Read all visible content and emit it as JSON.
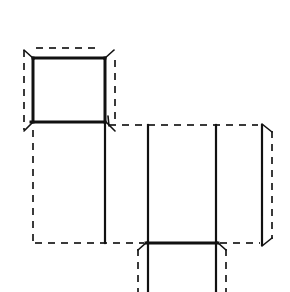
{
  "figure": {
    "background_color": "#ffffff",
    "solid_line_color": "#111111",
    "dashed_line_color": "#3a3a3a",
    "canvas": {
      "width": 290,
      "height": 292
    }
  },
  "geometry": {
    "solid_edges": [
      {
        "name": "top-square-top-edge",
        "x1": 33,
        "y1": 58,
        "x2": 105,
        "y2": 58
      },
      {
        "name": "top-square-left-edge",
        "x1": 33,
        "y1": 58,
        "x2": 33,
        "y2": 122
      },
      {
        "name": "top-square-bottom-edge",
        "x1": 31,
        "y1": 122,
        "x2": 105,
        "y2": 122
      },
      {
        "name": "top-square-right-edge",
        "x1": 105,
        "y1": 58,
        "x2": 105,
        "y2": 122
      },
      {
        "name": "left-panel-right-fold",
        "x1": 105,
        "y1": 122,
        "x2": 105,
        "y2": 243
      },
      {
        "name": "center-panel-left-fold",
        "x1": 148,
        "y1": 125,
        "x2": 148,
        "y2": 243
      },
      {
        "name": "center-panel-right-fold",
        "x1": 216,
        "y1": 125,
        "x2": 216,
        "y2": 243
      },
      {
        "name": "right-panel-right-edge",
        "x1": 262,
        "y1": 125,
        "x2": 262,
        "y2": 245
      },
      {
        "name": "center-panel-bottom-edge",
        "x1": 146,
        "y1": 243,
        "x2": 218,
        "y2": 243
      },
      {
        "name": "bottom-flap-left-fold",
        "x1": 148,
        "y1": 243,
        "x2": 148,
        "y2": 292
      },
      {
        "name": "bottom-flap-right-fold",
        "x1": 216,
        "y1": 243,
        "x2": 216,
        "y2": 292
      }
    ],
    "dashed_edges": [
      {
        "name": "top-square-outer-top",
        "x1": 36,
        "y1": 48,
        "x2": 101,
        "y2": 48
      },
      {
        "name": "top-square-outer-left",
        "x1": 24,
        "y1": 50,
        "x2": 24,
        "y2": 130
      },
      {
        "name": "top-square-outer-right",
        "x1": 115,
        "y1": 60,
        "x2": 115,
        "y2": 120
      },
      {
        "name": "left-panel-outer-left",
        "x1": 33,
        "y1": 130,
        "x2": 33,
        "y2": 241
      },
      {
        "name": "left-panel-outer-bottom",
        "x1": 35,
        "y1": 243,
        "x2": 144,
        "y2": 243
      },
      {
        "name": "center-top-dashed",
        "x1": 109,
        "y1": 125,
        "x2": 258,
        "y2": 125
      },
      {
        "name": "right-panel-outer-right",
        "x1": 272,
        "y1": 131,
        "x2": 272,
        "y2": 239
      },
      {
        "name": "right-lower-dashed",
        "x1": 220,
        "y1": 243,
        "x2": 260,
        "y2": 243
      },
      {
        "name": "bottom-flap-outer-left",
        "x1": 138,
        "y1": 249,
        "x2": 138,
        "y2": 292
      },
      {
        "name": "bottom-flap-outer-right",
        "x1": 226,
        "y1": 249,
        "x2": 226,
        "y2": 292
      }
    ],
    "corner_connectors": [
      {
        "name": "top-left-bevel",
        "x1": 24,
        "y1": 50,
        "x2": 34,
        "y2": 59
      },
      {
        "name": "top-right-bevel",
        "x1": 114,
        "y1": 50,
        "x2": 104,
        "y2": 59
      },
      {
        "name": "bottom-left-bevel",
        "x1": 24,
        "y1": 131,
        "x2": 33,
        "y2": 122
      },
      {
        "name": "bottom-right-bevel",
        "x1": 115,
        "y1": 131,
        "x2": 106,
        "y2": 122
      },
      {
        "name": "center-top-left-bevel",
        "x1": 108,
        "y1": 116,
        "x2": 109,
        "y2": 126
      },
      {
        "name": "right-top-bevel",
        "x1": 272,
        "y1": 132,
        "x2": 262,
        "y2": 124
      },
      {
        "name": "right-bottom-bevel",
        "x1": 272,
        "y1": 238,
        "x2": 262,
        "y2": 246
      },
      {
        "name": "flap-left-bevel",
        "x1": 138,
        "y1": 250,
        "x2": 147,
        "y2": 242
      },
      {
        "name": "flap-right-bevel",
        "x1": 226,
        "y1": 250,
        "x2": 217,
        "y2": 242
      }
    ]
  }
}
